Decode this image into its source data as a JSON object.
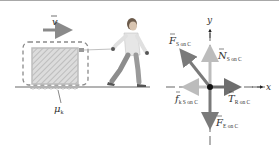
{
  "figure": {
    "type": "free-body-diagram",
    "scene": {
      "velocity_label": "v",
      "friction_label": "μ",
      "friction_subscript": "k",
      "objects": [
        "crate",
        "rope",
        "man",
        "ground",
        "system-boundary"
      ]
    },
    "fbd": {
      "axis_x_label": "x",
      "axis_y_label": "y",
      "forces": [
        {
          "id": "F_S_on_C",
          "symbol": "F",
          "subscript": "S on C",
          "direction": "up-left",
          "color": "#7a7a7a"
        },
        {
          "id": "N_S_on_C",
          "symbol": "N",
          "subscript": "S on C",
          "direction": "up",
          "color": "#bcbcbc"
        },
        {
          "id": "T_R_on_C",
          "symbol": "T",
          "subscript": "R on C",
          "direction": "right",
          "color": "#6e6e6e"
        },
        {
          "id": "f_k_S_on_C",
          "symbol": "f",
          "subscript": "k S on C",
          "direction": "left",
          "color": "#c4c4c4"
        },
        {
          "id": "F_E_on_C",
          "symbol": "F",
          "subscript": "E on C",
          "direction": "down",
          "color": "#7a7a7a"
        }
      ]
    },
    "colors": {
      "crate_fill": "#d6d6d6",
      "crate_hatch": "#b4b4b4",
      "boundary": "#8a8a8a",
      "ground": "#9a9a9a",
      "particle": "#111111"
    }
  }
}
